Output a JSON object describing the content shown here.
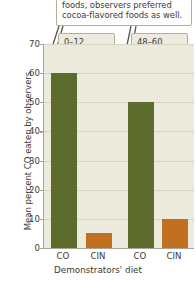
{
  "callouts": {
    "caption_line1": "foods, observers preferred",
    "caption_line2": "cocoa-flavored foods as well.",
    "period_a_line1": "0–12",
    "period_a_line2": "hours",
    "period_b_line1": "48–60",
    "period_b_line2": "hours"
  },
  "colors": {
    "green": "#5d6b2c",
    "orange": "#c2701f",
    "plot_background": "#eceadd",
    "gridline": "#d8d4c3",
    "axis": "#a9a493",
    "callout_border": "#b5ae9a",
    "callout_fill": "#edeade",
    "text": "#3d3a33"
  },
  "chart_data": {
    "type": "bar",
    "title": "",
    "xlabel": "Demonstrators' diet",
    "ylabel": "Mean percent CO eaten by observers",
    "categories": [
      "CO",
      "CIN",
      "CO",
      "CIN"
    ],
    "values": [
      60,
      5,
      50,
      10
    ],
    "bar_colors": [
      "#5d6b2c",
      "#c2701f",
      "#5d6b2c",
      "#c2701f"
    ],
    "groups": [
      {
        "label": "0–12 hours",
        "categories": [
          "CO",
          "CIN"
        ],
        "values": [
          60,
          5
        ]
      },
      {
        "label": "48–60 hours",
        "categories": [
          "CO",
          "CIN"
        ],
        "values": [
          50,
          10
        ]
      }
    ],
    "ylim": [
      0,
      70
    ],
    "yticks": [
      0,
      10,
      20,
      30,
      40,
      50,
      60,
      70
    ],
    "ytick_labels": [
      "0",
      "10",
      "20",
      "30",
      "40",
      "50",
      "60",
      "70"
    ],
    "grid": true,
    "legend": "none"
  }
}
